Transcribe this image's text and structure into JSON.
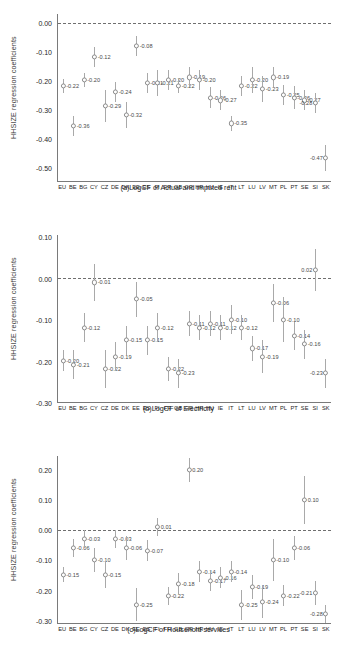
{
  "figure": {
    "ylabel": "HHSIZE regression coefficients",
    "categories": [
      "EU",
      "BE",
      "BG",
      "CY",
      "CZ",
      "DE",
      "DK",
      "EE",
      "ES",
      "FI",
      "FR",
      "GB",
      "GR",
      "HR",
      "HU",
      "IE",
      "IT",
      "LT",
      "LU",
      "LV",
      "MT",
      "PL",
      "PT",
      "SE",
      "SI",
      "SK"
    ]
  },
  "chart_data": [
    {
      "type": "scatter",
      "panel": "a",
      "title": "(a)LogCF of Actual and imputed rent",
      "xlabel": "",
      "ylabel": "HHSIZE regression coefficients",
      "ylim": [
        -0.55,
        0.03
      ],
      "yticks": [
        0.0,
        -0.1,
        -0.2,
        -0.3,
        -0.4,
        -0.5
      ],
      "ytick_labels": [
        "0.00",
        "-0.10",
        "-0.20",
        "-0.30",
        "-0.40",
        "-0.50"
      ],
      "grid": false,
      "zero_reference": 0.0,
      "categories": [
        "EU",
        "BE",
        "BG",
        "CY",
        "CZ",
        "DE",
        "DK",
        "EE",
        "ES",
        "FI",
        "FR",
        "GB",
        "GR",
        "HR",
        "HU",
        "IE",
        "IT",
        "LT",
        "LU",
        "LV",
        "MT",
        "PL",
        "PT",
        "SE",
        "SI",
        "SK"
      ],
      "values": [
        -0.22,
        -0.36,
        -0.2,
        -0.12,
        -0.29,
        -0.24,
        -0.32,
        -0.08,
        -0.21,
        -0.21,
        -0.2,
        -0.22,
        -0.19,
        -0.2,
        -0.26,
        -0.27,
        -0.35,
        -0.22,
        -0.2,
        -0.23,
        -0.19,
        -0.25,
        -0.26,
        -0.27,
        -0.28,
        -0.47
      ],
      "labels": [
        "-0.22",
        "-0.36",
        "-0.20",
        "-0.12",
        "-0.29",
        "-0.24",
        "-0.32",
        "-0.08",
        "-0.21",
        "-0.21",
        "-0.20",
        "-0.22",
        "-0.19",
        "-0.20",
        "-0.26",
        "-0.27",
        "-0.35",
        "-0.22",
        "-0.20",
        "-0.23",
        "-0.19",
        "-0.25",
        "-0.26",
        "-0.27",
        "-0.28",
        "-0.47"
      ],
      "ci_low": [
        -0.245,
        -0.395,
        -0.225,
        -0.155,
        -0.345,
        -0.275,
        -0.365,
        -0.115,
        -0.245,
        -0.255,
        -0.235,
        -0.245,
        -0.225,
        -0.235,
        -0.295,
        -0.305,
        -0.375,
        -0.255,
        -0.245,
        -0.275,
        -0.225,
        -0.285,
        -0.3,
        -0.305,
        -0.315,
        -0.515
      ],
      "ci_high": [
        -0.195,
        -0.325,
        -0.175,
        -0.085,
        -0.235,
        -0.205,
        -0.275,
        -0.045,
        -0.175,
        -0.165,
        -0.165,
        -0.195,
        -0.155,
        -0.165,
        -0.225,
        -0.235,
        -0.325,
        -0.185,
        -0.155,
        -0.185,
        -0.155,
        -0.215,
        -0.22,
        -0.235,
        -0.245,
        -0.425
      ]
    },
    {
      "type": "scatter",
      "panel": "b",
      "title": "(b)LogCF of Electricity",
      "xlabel": "",
      "ylabel": "HHSIZE regression coefficients",
      "ylim": [
        -0.3,
        0.105
      ],
      "yticks": [
        0.1,
        0.0,
        -0.1,
        -0.2,
        -0.3
      ],
      "ytick_labels": [
        "0.10",
        "0.00",
        "-0.10",
        "-0.20",
        "-0.30"
      ],
      "grid": false,
      "zero_reference": 0.0,
      "categories": [
        "EU",
        "BE",
        "BG",
        "CY",
        "CZ",
        "DE",
        "DK",
        "EE",
        "ES",
        "FI",
        "FR",
        "GB",
        "GR",
        "HR",
        "HU",
        "IE",
        "IT",
        "LT",
        "LU",
        "LV",
        "MT",
        "PL",
        "PT",
        "SE",
        "SI",
        "SK"
      ],
      "values": [
        -0.2,
        -0.21,
        -0.12,
        -0.01,
        -0.22,
        -0.19,
        -0.15,
        -0.05,
        -0.15,
        -0.12,
        -0.22,
        -0.23,
        -0.11,
        -0.12,
        -0.11,
        -0.12,
        -0.1,
        -0.12,
        -0.17,
        -0.19,
        -0.06,
        -0.1,
        -0.14,
        -0.16,
        0.02,
        -0.23
      ],
      "labels": [
        "-0.20",
        "-0.21",
        "-0.12",
        "-0.01",
        "-0.22",
        "-0.19",
        "-0.15",
        "-0.05",
        "-0.15",
        "-0.12",
        "-0.22",
        "-0.23",
        "-0.11",
        "-0.12",
        "-0.11",
        "-0.12",
        "-0.10",
        "-0.12",
        "-0.17",
        "-0.19",
        "-0.06",
        "-0.10",
        "-0.14",
        "-0.16",
        "0.02",
        "-0.23"
      ],
      "ci_low": [
        -0.225,
        -0.245,
        -0.155,
        -0.055,
        -0.265,
        -0.225,
        -0.185,
        -0.095,
        -0.185,
        -0.155,
        -0.25,
        -0.265,
        -0.14,
        -0.15,
        -0.14,
        -0.15,
        -0.135,
        -0.15,
        -0.2,
        -0.23,
        -0.105,
        -0.155,
        -0.175,
        -0.195,
        -0.03,
        -0.265
      ],
      "ci_high": [
        -0.175,
        -0.175,
        -0.085,
        0.035,
        -0.175,
        -0.155,
        -0.115,
        -0.01,
        -0.115,
        -0.085,
        -0.19,
        -0.195,
        -0.08,
        -0.09,
        -0.08,
        -0.09,
        -0.065,
        -0.09,
        -0.14,
        -0.15,
        -0.015,
        -0.045,
        -0.105,
        -0.125,
        0.07,
        -0.195
      ]
    },
    {
      "type": "scatter",
      "panel": "c",
      "title": "(c)LogCF of Household services",
      "xlabel": "",
      "ylabel": "HHSIZE regression coefficients",
      "ylim": [
        -0.31,
        0.245
      ],
      "yticks": [
        0.2,
        0.1,
        0.0,
        -0.1,
        -0.2,
        -0.3
      ],
      "ytick_labels": [
        "0.20",
        "0.10",
        "0.00",
        "-0.10",
        "-0.20",
        "-0.30"
      ],
      "grid": false,
      "zero_reference": 0.0,
      "categories": [
        "EU",
        "BE",
        "BG",
        "CY",
        "CZ",
        "DE",
        "DK",
        "EE",
        "ES",
        "FI",
        "FR",
        "GB",
        "GR",
        "HR",
        "HU",
        "IE",
        "IT",
        "LT",
        "LU",
        "LV",
        "MT",
        "PL",
        "PT",
        "SE",
        "SI",
        "SK"
      ],
      "values": [
        -0.15,
        -0.06,
        -0.03,
        -0.1,
        -0.15,
        -0.03,
        -0.06,
        -0.25,
        -0.07,
        0.01,
        -0.22,
        -0.18,
        0.2,
        -0.14,
        -0.17,
        -0.16,
        -0.14,
        -0.25,
        -0.19,
        -0.24,
        -0.1,
        -0.22,
        -0.06,
        0.1,
        -0.21,
        -0.28
      ],
      "labels": [
        "-0.15",
        "-0.06",
        "-0.03",
        "-0.10",
        "-0.15",
        "-0.03",
        "-0.06",
        "-0.25",
        "-0.07",
        "0.01",
        "-0.22",
        "-0.18",
        "0.20",
        "-0.14",
        "-0.17",
        "-0.16",
        "-0.14",
        "-0.25",
        "-0.19",
        "-0.24",
        "-0.10",
        "-0.22",
        "-0.06",
        "0.10",
        "-0.21",
        "-0.28"
      ],
      "ci_low": [
        -0.175,
        -0.09,
        -0.06,
        -0.14,
        -0.195,
        -0.06,
        -0.1,
        -0.305,
        -0.105,
        -0.02,
        -0.25,
        -0.215,
        0.16,
        -0.175,
        -0.205,
        -0.195,
        -0.175,
        -0.3,
        -0.23,
        -0.295,
        -0.17,
        -0.255,
        -0.1,
        0.02,
        -0.25,
        -0.31
      ],
      "ci_high": [
        -0.125,
        -0.03,
        0.0,
        -0.06,
        -0.105,
        0.0,
        -0.02,
        -0.195,
        -0.035,
        0.04,
        -0.19,
        -0.145,
        0.24,
        -0.105,
        -0.135,
        -0.125,
        -0.105,
        -0.2,
        -0.15,
        -0.185,
        -0.03,
        -0.185,
        -0.02,
        0.18,
        -0.17,
        -0.25
      ]
    }
  ]
}
